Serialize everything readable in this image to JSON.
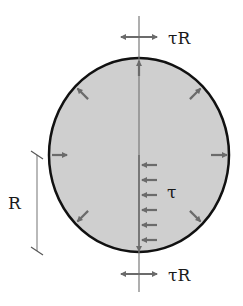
{
  "diagram": {
    "labels": {
      "top_resultant": "τR",
      "bottom_resultant": "τR",
      "shear_stress": "τ",
      "radius": "R"
    },
    "colors": {
      "fill": "#cfcfcf",
      "outline": "#111111",
      "arrow": "#6b6b6b",
      "axis": "#7a7a7a"
    },
    "shear_arrow_count": 6,
    "boundary_arrow_count": 8
  }
}
